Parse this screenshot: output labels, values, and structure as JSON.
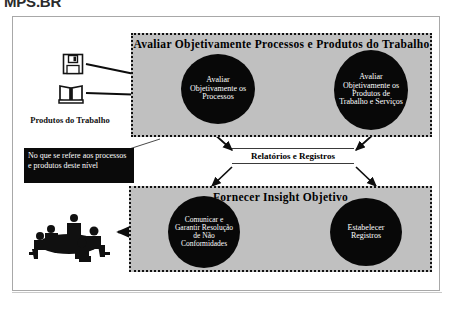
{
  "document": {
    "heading": "MPS.BR"
  },
  "diagram": {
    "groups": [
      {
        "id": "avaliar",
        "title": "Avaliar Objetivamente Processos e Produtos do Trabalho",
        "nodes": [
          {
            "id": "processos",
            "label": "Avaliar Objetivamente os Processos"
          },
          {
            "id": "produtos",
            "label": "Avaliar Objetivamente os Produtos de Trabalho e Serviços"
          }
        ]
      },
      {
        "id": "insight",
        "title": "Fornecer Insight Objetivo",
        "nodes": [
          {
            "id": "comunicar",
            "label": "Comunicar e Garantir Resolução de Não Conformidades"
          },
          {
            "id": "registros",
            "label": "Estabelecer Registros"
          }
        ]
      }
    ],
    "connector_label": "Relatórios e Registros",
    "callout": "No que se refere aos processos e produtos deste nível",
    "input_label": "Produtos do Trabalho",
    "icons": {
      "floppy": "floppy-disk-icon",
      "book": "open-book-icon",
      "meeting": "meeting-table-icon"
    }
  },
  "colors": {
    "group_fill": "#c0c0c0",
    "node_fill": "#080808",
    "node_text": "#ffffff",
    "frame_border": "#a8a8a8",
    "callout_fill": "#0a0a0a"
  }
}
